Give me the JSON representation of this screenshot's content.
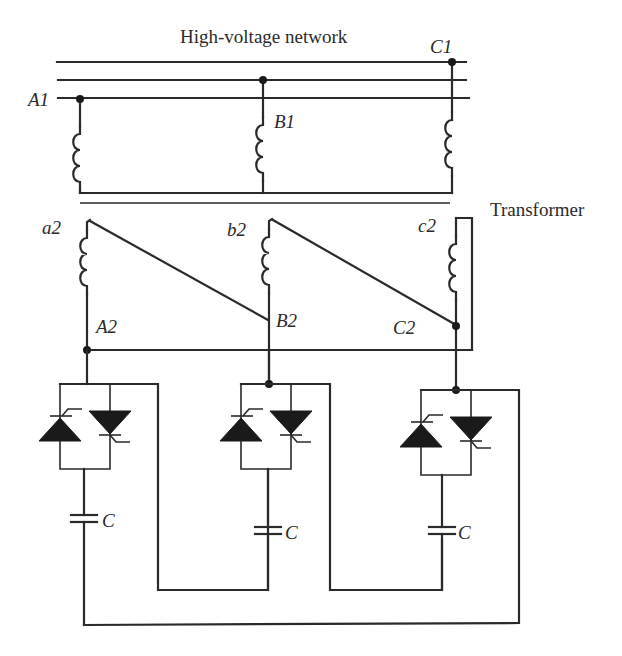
{
  "title": "High-voltage network",
  "transformer_label": "Transformer",
  "primary": {
    "nodes": [
      {
        "id": "A1",
        "label": "A1"
      },
      {
        "id": "B1",
        "label": "B1"
      },
      {
        "id": "C1",
        "label": "C1"
      }
    ]
  },
  "secondary": {
    "windings": [
      {
        "id": "a2",
        "label": "a2"
      },
      {
        "id": "b2",
        "label": "b2"
      },
      {
        "id": "c2",
        "label": "c2"
      }
    ],
    "nodes": [
      {
        "id": "A2",
        "label": "A2"
      },
      {
        "id": "B2",
        "label": "B2"
      },
      {
        "id": "C2",
        "label": "C2"
      }
    ]
  },
  "capacitors": [
    {
      "label": "C"
    },
    {
      "label": "C"
    },
    {
      "label": "C"
    }
  ],
  "branches": [
    {
      "name": "phase-a-branch",
      "components": [
        "antiparallel thyristors",
        "capacitor C"
      ]
    },
    {
      "name": "phase-b-branch",
      "components": [
        "antiparallel thyristors",
        "capacitor C"
      ]
    },
    {
      "name": "phase-c-branch",
      "components": [
        "antiparallel thyristors",
        "capacitor C"
      ]
    }
  ],
  "colors": {
    "line": "#2a2a2a",
    "background": "#ffffff"
  }
}
